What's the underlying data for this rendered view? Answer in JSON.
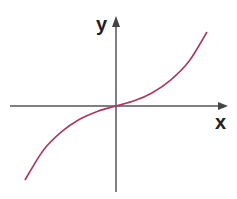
{
  "chart_data": {
    "type": "line",
    "title": "",
    "xlabel": "x",
    "ylabel": "y",
    "grid": false,
    "legend": null,
    "series": [
      {
        "name": "curve",
        "color": "#a83a5e",
        "x": [
          -1.0,
          -0.8,
          -0.6,
          -0.4,
          -0.2,
          0.0,
          0.2,
          0.4,
          0.6,
          0.8,
          1.0
        ],
        "y": [
          -1.0,
          -0.6,
          -0.35,
          -0.18,
          -0.07,
          0.0,
          0.07,
          0.18,
          0.35,
          0.6,
          1.0
        ]
      }
    ],
    "xlim": [
      -1.2,
      1.2
    ],
    "ylim": [
      -1.0,
      1.0
    ]
  },
  "colors": {
    "axis": "#555555",
    "curve": "#a83a5e",
    "label": "#222222"
  },
  "labels": {
    "x": "x",
    "y": "y"
  }
}
